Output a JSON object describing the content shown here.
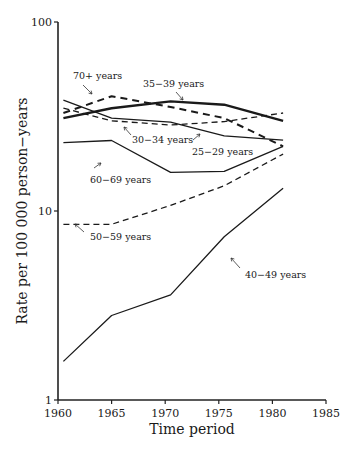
{
  "chart_data": {
    "type": "line",
    "title": "",
    "xlabel": "Time period",
    "ylabel": "Rate per 100 000 person−years",
    "xlim": [
      1960,
      1985
    ],
    "ylim": [
      1,
      100
    ],
    "yscale": "log",
    "grid": false,
    "x_ticks": [
      "1960",
      "1965",
      "1970",
      "1975",
      "1980",
      "1985"
    ],
    "y_ticks": [
      "1",
      "10",
      "100"
    ],
    "x": [
      1960.5,
      1965,
      1970.5,
      1975.5,
      1981
    ],
    "series": [
      {
        "name": "25−29 years",
        "style": "solid",
        "values": [
          1.6,
          2.8,
          3.6,
          7.3,
          13.2
        ]
      },
      {
        "name": "30−34 years",
        "style": "dashed",
        "values": [
          8.5,
          8.5,
          10.7,
          13.6,
          20
        ]
      },
      {
        "name": "35−39 years",
        "style": "solid",
        "values": [
          23,
          23.6,
          16,
          16.2,
          22
        ]
      },
      {
        "name": "40−49 years",
        "style": "dashed-bold",
        "values": [
          33,
          40.5,
          35.5,
          31,
          22
        ]
      },
      {
        "name": "50−59 years",
        "style": "solid-bold",
        "values": [
          31,
          35,
          38,
          36.5,
          30
        ]
      },
      {
        "name": "60−69 years",
        "style": "solid",
        "values": [
          38.6,
          31,
          29.5,
          25,
          23.7
        ]
      },
      {
        "name": "70+ years",
        "style": "dashed",
        "values": [
          35,
          30,
          28.5,
          29.7,
          33
        ]
      }
    ],
    "annotations": [
      {
        "text": "40−49 years",
        "series": "40−49 years"
      },
      {
        "text": "50−59 years",
        "series": "50−59 years"
      },
      {
        "text": "60−69 years",
        "series": "60−69 years"
      },
      {
        "text": "70+ years",
        "series": "70+ years"
      },
      {
        "text": "35−39 years",
        "series": "35−39 years"
      },
      {
        "text": "30−34 years",
        "series": "30−34 years"
      },
      {
        "text": "25−29 years",
        "series": "25−29 years"
      }
    ]
  }
}
